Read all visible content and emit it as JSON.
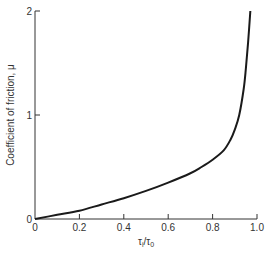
{
  "chart_data": {
    "type": "line",
    "title": "",
    "xlabel": "τᵢ/τ₀",
    "ylabel": "Coefficient of friction, μ",
    "xlim": [
      0,
      1.0
    ],
    "ylim": [
      0,
      2
    ],
    "x_ticks": [
      "0",
      "0.2",
      "0.4",
      "0.6",
      "0.8",
      "1.0"
    ],
    "y_ticks": [
      "0",
      "1",
      "2"
    ],
    "grid": false,
    "legend": null,
    "series": [
      {
        "name": "μ vs τi/τ0",
        "color": "#1a1a1a",
        "x": [
          0,
          0.1,
          0.2,
          0.3,
          0.4,
          0.5,
          0.6,
          0.7,
          0.75,
          0.8,
          0.85,
          0.88,
          0.9,
          0.92,
          0.94,
          0.95,
          0.96,
          0.97
        ],
        "y": [
          0,
          0.04,
          0.08,
          0.14,
          0.2,
          0.27,
          0.35,
          0.44,
          0.5,
          0.57,
          0.66,
          0.76,
          0.86,
          1.0,
          1.25,
          1.45,
          1.7,
          2.0
        ]
      }
    ]
  },
  "axes": {
    "x_label_main": "τ",
    "x_label_sub1": "i",
    "x_label_slash": "/τ",
    "x_label_sub2": "0",
    "y_label": "Coefficient of friction, μ"
  }
}
